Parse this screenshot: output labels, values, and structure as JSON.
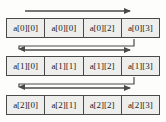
{
  "diagram": {
    "colors": {
      "background": "#fdfdfb",
      "cell_fill": "#eeeeec",
      "border": "#4a4a4a",
      "arrow": "#4a4a4a"
    },
    "rows": [
      {
        "name": "row-0",
        "cells": [
          "a[0][0]",
          "a[0][0]",
          "a[0][2]",
          "a[0][3]"
        ]
      },
      {
        "name": "row-1",
        "cells": [
          "a[1][0]",
          "a[1][1]",
          "a[1][2]",
          "a[1][3]"
        ]
      },
      {
        "name": "row-2",
        "cells": [
          "a[2][0]",
          "a[2][1]",
          "a[2][2]",
          "a[2][3]"
        ]
      }
    ],
    "arrows": [
      {
        "name": "traverse-arrow-row-0",
        "direction": "right"
      },
      {
        "name": "wrap-connector-row-0-to-row-1",
        "direction": "down-left"
      },
      {
        "name": "traverse-arrow-row-1",
        "direction": "right"
      },
      {
        "name": "wrap-connector-row-1-to-row-2",
        "direction": "down-left"
      },
      {
        "name": "traverse-arrow-row-2",
        "direction": "right"
      }
    ]
  }
}
